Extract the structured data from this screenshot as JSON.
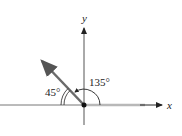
{
  "diagram": {
    "axes": {
      "x_label": "x",
      "y_label": "y"
    },
    "angles": [
      {
        "label": "45°",
        "measure": 45,
        "from": "negative x-axis",
        "marks": "double arc"
      },
      {
        "label": "135°",
        "measure": 135,
        "from": "positive x-axis",
        "marks": "single arc with arrow"
      }
    ],
    "vector": {
      "direction_deg": 135,
      "description": "vector from origin into second quadrant"
    },
    "colors": {
      "axis": "#555555",
      "vector": "#6b6b6b",
      "ray_highlight": "#b8b8b8",
      "text": "#222222"
    }
  }
}
